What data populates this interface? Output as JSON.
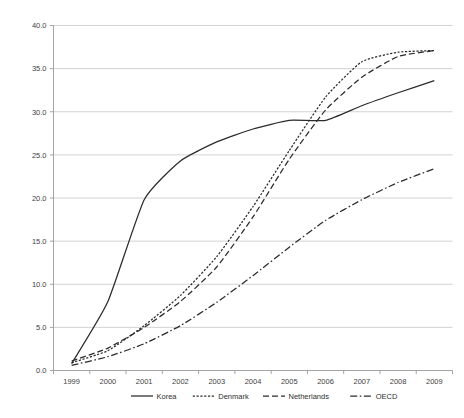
{
  "chart_data": {
    "type": "line",
    "title": "",
    "subtitle": "",
    "xlabel": "",
    "ylabel": "",
    "x": [
      1999,
      2000,
      2001,
      2002,
      2003,
      2004,
      2005,
      2006,
      2007,
      2008,
      2009
    ],
    "categories": [
      "1999",
      "2000",
      "2001",
      "2002",
      "2003",
      "2004",
      "2005",
      "2006",
      "2007",
      "2008",
      "2009"
    ],
    "xlim": [
      1999,
      2009
    ],
    "ylim": [
      0.0,
      40.0
    ],
    "y_ticks": [
      0.0,
      5.0,
      10.0,
      15.0,
      20.0,
      25.0,
      30.0,
      35.0,
      40.0
    ],
    "y_tick_labels": [
      "0.0",
      "5.0",
      "10.0",
      "15.0",
      "20.0",
      "25.0",
      "30.0",
      "35.0",
      "40.0"
    ],
    "x_tick_labels": [
      "1999",
      "2000",
      "2001",
      "2002",
      "2003",
      "2004",
      "2005",
      "2006",
      "2007",
      "2008",
      "2009"
    ],
    "grid": "horizontal",
    "legend_position": "bottom",
    "series": [
      {
        "name": "Korea",
        "style": "solid",
        "color": "#2b2b2b",
        "values": [
          0.8,
          8.0,
          19.8,
          24.3,
          26.5,
          28.0,
          29.0,
          29.0,
          30.7,
          32.2,
          33.6
        ]
      },
      {
        "name": "Denmark",
        "style": "dotted",
        "color": "#2b2b2b",
        "values": [
          0.9,
          2.3,
          5.2,
          8.7,
          13.2,
          19.0,
          25.5,
          31.7,
          35.8,
          36.9,
          37.1
        ]
      },
      {
        "name": "Netherlands",
        "style": "dashed",
        "color": "#2b2b2b",
        "values": [
          1.1,
          2.6,
          5.0,
          8.0,
          12.0,
          17.8,
          24.5,
          30.2,
          34.0,
          36.4,
          37.1
        ]
      },
      {
        "name": "OECD",
        "style": "dashdot",
        "color": "#2b2b2b",
        "values": [
          0.6,
          1.6,
          3.1,
          5.2,
          7.9,
          11.0,
          14.3,
          17.4,
          19.8,
          21.8,
          23.4
        ]
      }
    ]
  },
  "legend": {
    "items": [
      {
        "label": "Korea"
      },
      {
        "label": "Denmark"
      },
      {
        "label": "Netherlands"
      },
      {
        "label": "OECD"
      }
    ]
  }
}
